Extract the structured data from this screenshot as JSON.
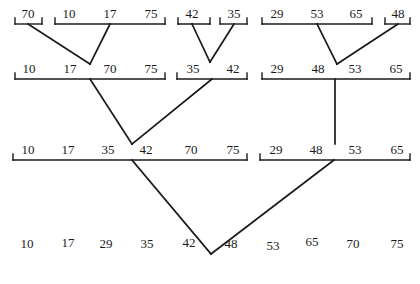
{
  "colors": {
    "stroke": "#1a1a1a",
    "text": "#1a1a1a",
    "background": "#ffffff"
  },
  "levels": [
    {
      "name": "level-1",
      "bracket_y": 24,
      "groups": [
        {
          "x1": 15,
          "x2": 42,
          "values": [
            {
              "v": "70",
              "x": 28
            }
          ]
        },
        {
          "x1": 55,
          "x2": 165,
          "values": [
            {
              "v": "10",
              "x": 69
            },
            {
              "v": "17",
              "x": 110
            },
            {
              "v": "75",
              "x": 151
            }
          ]
        },
        {
          "x1": 178,
          "x2": 210,
          "values": [
            {
              "v": "42",
              "x": 192
            }
          ]
        },
        {
          "x1": 220,
          "x2": 247,
          "values": [
            {
              "v": "35",
              "x": 234
            }
          ]
        },
        {
          "x1": 262,
          "x2": 372,
          "values": [
            {
              "v": "29",
              "x": 277
            },
            {
              "v": "53",
              "x": 317
            },
            {
              "v": "65",
              "x": 356
            }
          ]
        },
        {
          "x1": 385,
          "x2": 410,
          "values": [
            {
              "v": "48",
              "x": 398
            }
          ]
        }
      ]
    },
    {
      "name": "level-2",
      "bracket_y": 79,
      "groups": [
        {
          "x1": 15,
          "x2": 165,
          "values": [
            {
              "v": "10",
              "x": 29
            },
            {
              "v": "17",
              "x": 70
            },
            {
              "v": "70",
              "x": 110
            },
            {
              "v": "75",
              "x": 151
            }
          ]
        },
        {
          "x1": 177,
          "x2": 247,
          "values": [
            {
              "v": "35",
              "x": 193
            },
            {
              "v": "42",
              "x": 233
            }
          ]
        },
        {
          "x1": 262,
          "x2": 410,
          "values": [
            {
              "v": "29",
              "x": 277
            },
            {
              "v": "48",
              "x": 318
            },
            {
              "v": "53",
              "x": 355
            },
            {
              "v": "65",
              "x": 396
            }
          ]
        }
      ]
    },
    {
      "name": "level-3",
      "bracket_y": 160,
      "groups": [
        {
          "x1": 13,
          "x2": 247,
          "values": [
            {
              "v": "10",
              "x": 28
            },
            {
              "v": "17",
              "x": 68
            },
            {
              "v": "35",
              "x": 108
            },
            {
              "v": "42",
              "x": 146
            },
            {
              "v": "70",
              "x": 191
            },
            {
              "v": "75",
              "x": 233
            }
          ]
        },
        {
          "x1": 260,
          "x2": 410,
          "values": [
            {
              "v": "29",
              "x": 276
            },
            {
              "v": "48",
              "x": 316
            },
            {
              "v": "53",
              "x": 355
            },
            {
              "v": "65",
              "x": 397
            }
          ]
        }
      ]
    }
  ],
  "final": {
    "y": 244,
    "values": [
      {
        "v": "10",
        "x": 27,
        "dy": 0
      },
      {
        "v": "17",
        "x": 68,
        "dy": -1
      },
      {
        "v": "29",
        "x": 106,
        "dy": 0
      },
      {
        "v": "35",
        "x": 147,
        "dy": 0
      },
      {
        "v": "42",
        "x": 189,
        "dy": -1
      },
      {
        "v": "48",
        "x": 231,
        "dy": 0
      },
      {
        "v": "53",
        "x": 273,
        "dy": 2
      },
      {
        "v": "65",
        "x": 312,
        "dy": -2
      },
      {
        "v": "70",
        "x": 353,
        "dy": 0
      },
      {
        "v": "75",
        "x": 397,
        "dy": 0
      }
    ]
  },
  "edges": [
    {
      "x1": 28,
      "y1": 24,
      "x2": 90,
      "y2": 64
    },
    {
      "x1": 110,
      "y1": 24,
      "x2": 90,
      "y2": 64
    },
    {
      "x1": 192,
      "y1": 24,
      "x2": 210,
      "y2": 62
    },
    {
      "x1": 234,
      "y1": 24,
      "x2": 210,
      "y2": 62
    },
    {
      "x1": 317,
      "y1": 24,
      "x2": 337,
      "y2": 64
    },
    {
      "x1": 398,
      "y1": 24,
      "x2": 337,
      "y2": 64
    },
    {
      "x1": 90,
      "y1": 79,
      "x2": 132,
      "y2": 144
    },
    {
      "x1": 212,
      "y1": 79,
      "x2": 132,
      "y2": 144
    },
    {
      "x1": 335,
      "y1": 79,
      "x2": 335,
      "y2": 144
    },
    {
      "x1": 132,
      "y1": 160,
      "x2": 211,
      "y2": 254
    },
    {
      "x1": 334,
      "y1": 160,
      "x2": 211,
      "y2": 254
    }
  ]
}
